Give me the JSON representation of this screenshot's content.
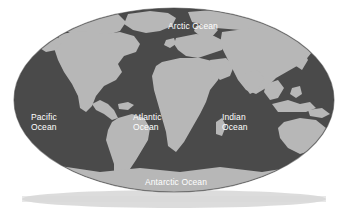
{
  "map": {
    "title": "World Map",
    "projection": "oval",
    "colors": {
      "background": "#ffffff",
      "ocean": "#4a4a4a",
      "land": "#b7b7b7",
      "label_text": "#ffffff",
      "ground_shadow": "#d6d6d6"
    },
    "labels": [
      {
        "id": "arctic",
        "name": "Arctic Ocean",
        "text": "Arctic Ocean"
      },
      {
        "id": "pacific",
        "name": "Pacific Ocean",
        "text": "Pacific\nOcean"
      },
      {
        "id": "atlantic",
        "name": "Atlantic Ocean",
        "text": "Atlantic\nOcean"
      },
      {
        "id": "indian",
        "name": "Indian Ocean",
        "text": "Indian\nOcean"
      },
      {
        "id": "antarctic",
        "name": "Antarctic Ocean",
        "text": "Antarctic Ocean"
      }
    ],
    "landmasses": [
      "North America",
      "South America",
      "Europe",
      "Africa",
      "Asia",
      "Australia",
      "Greenland",
      "Antarctica",
      "Indonesia",
      "Japan",
      "Madagascar",
      "New Zealand",
      "British Isles"
    ]
  }
}
